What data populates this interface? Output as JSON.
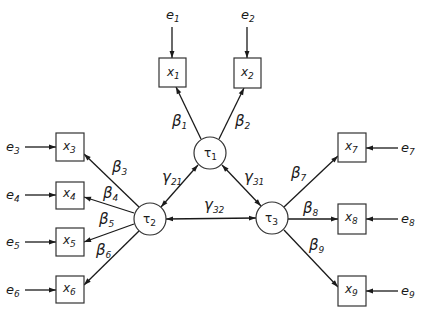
{
  "figure": {
    "type": "path diagram",
    "latent_nodes": [
      {
        "id": "tau1",
        "symbol": "τ",
        "sub": "1",
        "cx": 210,
        "cy": 153
      },
      {
        "id": "tau2",
        "symbol": "τ",
        "sub": "2",
        "cx": 150,
        "cy": 219
      },
      {
        "id": "tau3",
        "symbol": "τ",
        "sub": "3",
        "cx": 272,
        "cy": 218
      }
    ],
    "observed_nodes": [
      {
        "id": "x1",
        "symbol": "x",
        "sub": "1"
      },
      {
        "id": "x2",
        "symbol": "x",
        "sub": "2"
      },
      {
        "id": "x3",
        "symbol": "x",
        "sub": "3"
      },
      {
        "id": "x4",
        "symbol": "x",
        "sub": "4"
      },
      {
        "id": "x5",
        "symbol": "x",
        "sub": "5"
      },
      {
        "id": "x6",
        "symbol": "x",
        "sub": "6"
      },
      {
        "id": "x7",
        "symbol": "x",
        "sub": "7"
      },
      {
        "id": "x8",
        "symbol": "x",
        "sub": "8"
      },
      {
        "id": "x9",
        "symbol": "x",
        "sub": "9"
      }
    ],
    "error_terms": [
      {
        "id": "e1",
        "symbol": "e",
        "sub": "1",
        "target": "x1"
      },
      {
        "id": "e2",
        "symbol": "e",
        "sub": "2",
        "target": "x2"
      },
      {
        "id": "e3",
        "symbol": "e",
        "sub": "3",
        "target": "x3"
      },
      {
        "id": "e4",
        "symbol": "e",
        "sub": "4",
        "target": "x4"
      },
      {
        "id": "e5",
        "symbol": "e",
        "sub": "5",
        "target": "x5"
      },
      {
        "id": "e6",
        "symbol": "e",
        "sub": "6",
        "target": "x6"
      },
      {
        "id": "e7",
        "symbol": "e",
        "sub": "7",
        "target": "x7"
      },
      {
        "id": "e8",
        "symbol": "e",
        "sub": "8",
        "target": "x8"
      },
      {
        "id": "e9",
        "symbol": "e",
        "sub": "9",
        "target": "x9"
      }
    ],
    "loadings": [
      {
        "symbol": "β",
        "sub": "1",
        "from": "tau1",
        "to": "x1"
      },
      {
        "symbol": "β",
        "sub": "2",
        "from": "tau1",
        "to": "x2"
      },
      {
        "symbol": "β",
        "sub": "3",
        "from": "tau2",
        "to": "x3"
      },
      {
        "symbol": "β",
        "sub": "4",
        "from": "tau2",
        "to": "x4"
      },
      {
        "symbol": "β",
        "sub": "5",
        "from": "tau2",
        "to": "x5"
      },
      {
        "symbol": "β",
        "sub": "6",
        "from": "tau2",
        "to": "x6"
      },
      {
        "symbol": "β",
        "sub": "7",
        "from": "tau3",
        "to": "x7"
      },
      {
        "symbol": "β",
        "sub": "8",
        "from": "tau3",
        "to": "x8"
      },
      {
        "symbol": "β",
        "sub": "9",
        "from": "tau3",
        "to": "x9"
      }
    ],
    "correlations": [
      {
        "symbol": "γ",
        "sub": "21",
        "between": [
          "tau2",
          "tau1"
        ]
      },
      {
        "symbol": "γ",
        "sub": "31",
        "between": [
          "tau3",
          "tau1"
        ]
      },
      {
        "symbol": "γ",
        "sub": "32",
        "between": [
          "tau3",
          "tau2"
        ]
      }
    ]
  }
}
